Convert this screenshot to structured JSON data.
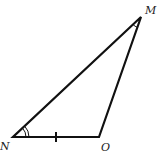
{
  "diagram": {
    "type": "triangle",
    "vertices": [
      {
        "name": "M",
        "x": 141,
        "y": 17
      },
      {
        "name": "N",
        "x": 13,
        "y": 137
      },
      {
        "name": "O",
        "x": 99,
        "y": 137
      }
    ],
    "labels": {
      "M": "M",
      "N": "N",
      "O": "O"
    },
    "markings": {
      "angle_N": "double-arc",
      "angle_M": "single-arc",
      "side_NO": "single-tick"
    },
    "stroke_color": "#111111"
  }
}
